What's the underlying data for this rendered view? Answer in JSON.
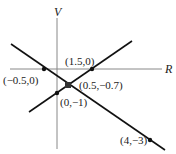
{
  "diagram": {
    "axes": {
      "vertical_label": "V",
      "horizontal_label": "R"
    },
    "lines": [
      {
        "name": "descending-line",
        "from": [
          11,
          44
        ],
        "to": [
          165,
          150
        ]
      },
      {
        "name": "ascending-line",
        "from": [
          29,
          112
        ],
        "to": [
          132,
          41
        ]
      }
    ],
    "points": [
      {
        "label": "(−0.5,0)",
        "x": 44,
        "y": 69
      },
      {
        "label": "(1.5,0)",
        "x": 92,
        "y": 69
      },
      {
        "label": "(0.5,−0.7)",
        "x": 68,
        "y": 85
      },
      {
        "label": "(0,−1)",
        "x": 57,
        "y": 93
      },
      {
        "label": "(4,−3)",
        "x": 150,
        "y": 140
      }
    ],
    "colors": {
      "axis": "#888888",
      "line": "#111111",
      "text": "#222222"
    }
  }
}
